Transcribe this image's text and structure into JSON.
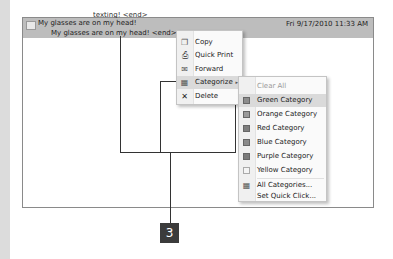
{
  "message_list": {
    "prev_row_text": "texting! <end>",
    "subject": "My glasses are on my head!",
    "date": "Fri 9/17/2010 11:33 AM",
    "preview": "My glasses are on my head! <end>"
  },
  "context_menu": {
    "items": [
      {
        "label": "Copy",
        "icon": "copy-icon"
      },
      {
        "label": "Quick Print",
        "icon": "print-icon"
      },
      {
        "label": "Forward",
        "icon": "forward-icon"
      },
      {
        "label": "Categorize",
        "icon": "categorize-icon",
        "submenu": true,
        "highlighted": true
      },
      {
        "label": "Delete",
        "icon": "delete-icon"
      }
    ],
    "submenu_arrow": "▸"
  },
  "categorize_submenu": {
    "clear_label": "Clear All Categories",
    "categories": [
      {
        "label": "Green Category",
        "color": "#8c8c8c",
        "highlighted": true
      },
      {
        "label": "Orange Category",
        "color": "#9a9a9a"
      },
      {
        "label": "Red Category",
        "color": "#7e7e7e"
      },
      {
        "label": "Blue Category",
        "color": "#8a8a8a"
      },
      {
        "label": "Purple Category",
        "color": "#7a7a7a"
      },
      {
        "label": "Yellow Category",
        "color": "#f4f4f4"
      }
    ],
    "all_categories_label": "All Categories...",
    "set_quick_click_label": "Set Quick Click..."
  },
  "callout": {
    "number": "3"
  }
}
